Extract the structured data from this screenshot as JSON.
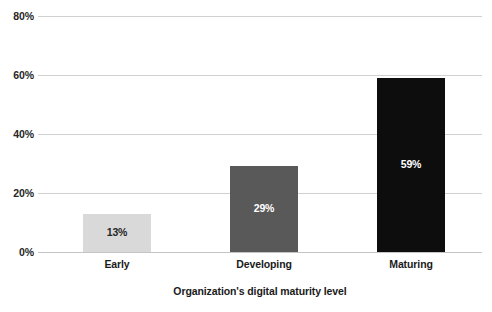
{
  "chart_data": {
    "type": "bar",
    "title": "",
    "xlabel": "Organization's digital maturity level",
    "ylabel": "",
    "categories": [
      "Early",
      "Developing",
      "Maturing"
    ],
    "values": [
      13,
      29,
      59
    ],
    "value_labels": [
      "13%",
      "29%",
      "59%"
    ],
    "bar_colors": [
      "#d9d9d9",
      "#595959",
      "#0d0d0d"
    ],
    "value_label_colors": [
      "#262626",
      "#ffffff",
      "#ffffff"
    ],
    "ylim": [
      0,
      80
    ],
    "yticks": [
      0,
      20,
      40,
      60,
      80
    ],
    "ytick_labels": [
      "0%",
      "20%",
      "40%",
      "60%",
      "80%"
    ],
    "grid": true,
    "grid_color": "#d0d0d0",
    "legend": "none",
    "background": "#ffffff"
  }
}
